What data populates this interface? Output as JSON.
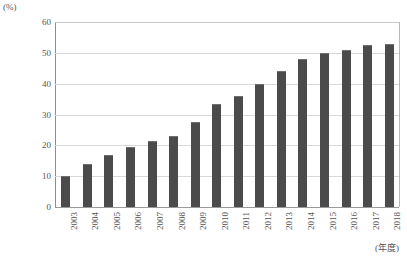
{
  "chart_data": {
    "type": "bar",
    "title": "",
    "subtitle": "",
    "xlabel": "(年度)",
    "ylabel": "(%)",
    "ylim": [
      0,
      60
    ],
    "yticks": [
      0,
      10,
      20,
      30,
      40,
      50,
      60
    ],
    "grid": true,
    "legend": false,
    "legend_position": "none",
    "bar_color": "#4b4b4b",
    "categories": [
      "2003",
      "2004",
      "2005",
      "2006",
      "2007",
      "2008",
      "2009",
      "2010",
      "2011",
      "2012",
      "2013",
      "2014",
      "2015",
      "2016",
      "2017",
      "2018"
    ],
    "values": [
      10.0,
      14.0,
      17.0,
      19.5,
      21.5,
      23.0,
      27.5,
      33.5,
      36.0,
      40.0,
      44.0,
      48.0,
      50.0,
      51.0,
      52.5,
      53.0
    ],
    "series": [
      {
        "name": "",
        "values": [
          10.0,
          14.0,
          17.0,
          19.5,
          21.5,
          23.0,
          27.5,
          33.5,
          36.0,
          40.0,
          44.0,
          48.0,
          50.0,
          51.0,
          52.5,
          53.0
        ]
      }
    ]
  }
}
